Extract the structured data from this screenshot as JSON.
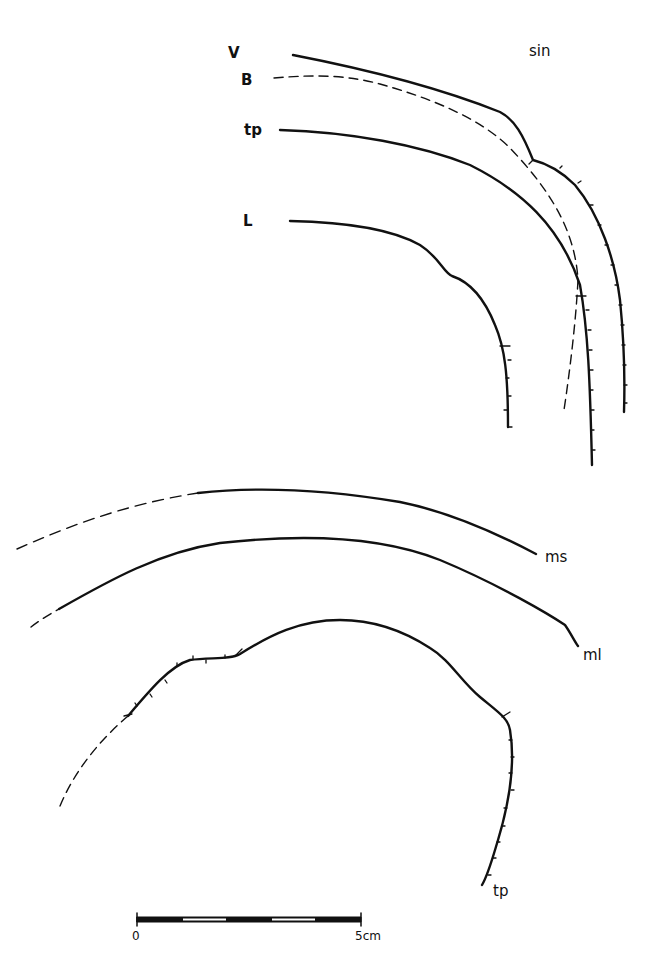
{
  "figure": {
    "side_label": "sin",
    "upper_labels": {
      "v": "V",
      "b": "B",
      "tp": "tp",
      "l": "L"
    },
    "lower_labels": {
      "ms": "ms",
      "ml": "ml",
      "tp": "tp"
    }
  },
  "scale_bar": {
    "start_label": "0",
    "end_label": "5cm",
    "segments": 5
  },
  "colors": {
    "ink": "#111111",
    "background": "#ffffff"
  }
}
